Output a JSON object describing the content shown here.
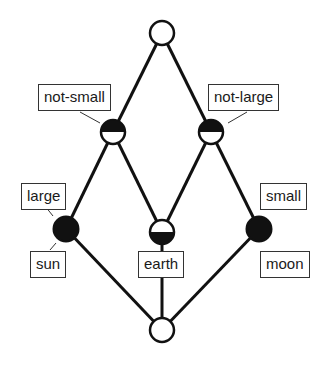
{
  "diagram": {
    "type": "concept-lattice",
    "colors": {
      "line": "#111111",
      "fill_dark": "#111111",
      "fill_light": "#ffffff",
      "label_border": "#333333"
    },
    "nodes": [
      {
        "id": "top",
        "x": 162,
        "y": 33,
        "style": "empty"
      },
      {
        "id": "not-small",
        "x": 113,
        "y": 132,
        "style": "half-top"
      },
      {
        "id": "not-large",
        "x": 211,
        "y": 132,
        "style": "half-top"
      },
      {
        "id": "large-sun",
        "x": 66,
        "y": 229,
        "style": "full"
      },
      {
        "id": "earth",
        "x": 162,
        "y": 232,
        "style": "half-bottom"
      },
      {
        "id": "small-moon",
        "x": 259,
        "y": 229,
        "style": "full"
      },
      {
        "id": "bottom",
        "x": 162,
        "y": 330,
        "style": "empty"
      }
    ],
    "edges": [
      [
        "top",
        "not-small"
      ],
      [
        "top",
        "not-large"
      ],
      [
        "not-small",
        "large-sun"
      ],
      [
        "not-small",
        "earth"
      ],
      [
        "not-large",
        "earth"
      ],
      [
        "not-large",
        "small-moon"
      ],
      [
        "large-sun",
        "bottom"
      ],
      [
        "earth",
        "bottom"
      ],
      [
        "small-moon",
        "bottom"
      ]
    ],
    "attribute_labels": {
      "not_small": "not-small",
      "not_large": "not-large",
      "large": "large",
      "small": "small"
    },
    "object_labels": {
      "sun": "sun",
      "earth": "earth",
      "moon": "moon"
    }
  }
}
